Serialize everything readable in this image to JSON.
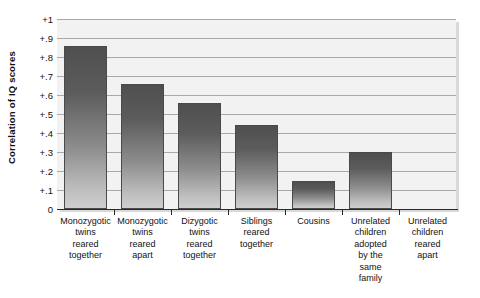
{
  "chart_data": {
    "type": "bar",
    "title": "",
    "subtitle": "",
    "xlabel": "",
    "ylabel": "Correlation of IQ scores",
    "categories": [
      "Monozygotic twins reared together",
      "Monozygotic twins reared apart",
      "Dizygotic twins reared together",
      "Siblings reared together",
      "Cousins",
      "Unrelated children adopted by the same family",
      "Unrelated children reared apart"
    ],
    "category_lines": [
      [
        "Monozygotic",
        "twins",
        "reared",
        "together"
      ],
      [
        "Monozygotic",
        "twins",
        "reared",
        "apart"
      ],
      [
        "Dizygotic",
        "twins",
        "reared",
        "together"
      ],
      [
        "Siblings",
        "reared",
        "together"
      ],
      [
        "Cousins"
      ],
      [
        "Unrelated",
        "children",
        "adopted",
        "by the",
        "same",
        "family"
      ],
      [
        "Unrelated",
        "children",
        "reared",
        "apart"
      ]
    ],
    "values": [
      0.86,
      0.66,
      0.56,
      0.44,
      0.15,
      0.3,
      0.0
    ],
    "ylim": [
      0,
      1
    ],
    "ytick_values": [
      0,
      0.1,
      0.2,
      0.3,
      0.4,
      0.5,
      0.6,
      0.7,
      0.8,
      0.9,
      1.0
    ],
    "ytick_labels": [
      "0",
      "+.1",
      "+.2",
      "+.3",
      "+.4",
      "+.5",
      "+.6",
      "+.7",
      "+.8",
      "+.9",
      "+1"
    ],
    "grid": true,
    "legend": "none",
    "bar_color_top": "#4f4f4f",
    "bar_color_bottom": "#cfcfcf",
    "plot_background": "#f2f2f2",
    "gridline_color": "#a9a9a9",
    "axis_color": "#2a2a2a"
  }
}
